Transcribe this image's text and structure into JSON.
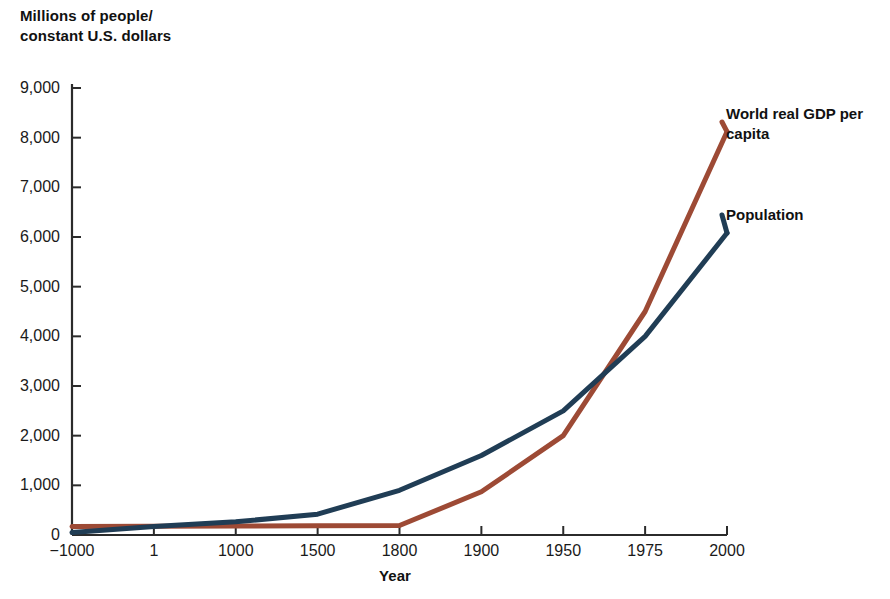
{
  "chart_data": {
    "type": "line",
    "title": "",
    "subtitle": "",
    "ylabel": "Millions of people/\nconstant U.S. dollars",
    "xlabel": "Year",
    "categories": [
      "−1000",
      "1",
      "1000",
      "1500",
      "1800",
      "1900",
      "1950",
      "1975",
      "2000"
    ],
    "ylim": [
      0,
      9000
    ],
    "yticks": [
      0,
      1000,
      2000,
      3000,
      4000,
      5000,
      6000,
      7000,
      8000,
      9000
    ],
    "ytick_labels": [
      "0",
      "1,000",
      "2,000",
      "3,000",
      "4,000",
      "5,000",
      "6,000",
      "7,000",
      "8,000",
      "9,000"
    ],
    "grid": false,
    "legend_position": "right-inline-labels",
    "series": [
      {
        "name": "World real GDP per capita",
        "color": "#9d4a35",
        "values": [
          170,
          175,
          180,
          185,
          190,
          870,
          2000,
          4500,
          8120
        ]
      },
      {
        "name": "Population",
        "color": "#203d55",
        "values": [
          50,
          170,
          265,
          420,
          900,
          1600,
          2500,
          4000,
          6080
        ]
      }
    ]
  },
  "labels": {
    "y_axis_title": "Millions of people/\nconstant U.S. dollars",
    "x_axis_title": "Year",
    "series_gdp": "World real GDP per\ncapita",
    "series_population": "Population"
  },
  "colors": {
    "gdp_line": "#9d4a35",
    "population_line": "#203d55",
    "axis": "#2b2b2b",
    "text": "#111111",
    "background": "#ffffff"
  }
}
